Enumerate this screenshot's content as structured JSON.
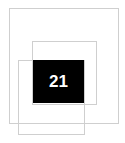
{
  "tile": {
    "label": "21",
    "background": "#000000",
    "color": "#ffffff"
  },
  "frames": {
    "border_color": "#cfcfcf",
    "count": 3
  }
}
